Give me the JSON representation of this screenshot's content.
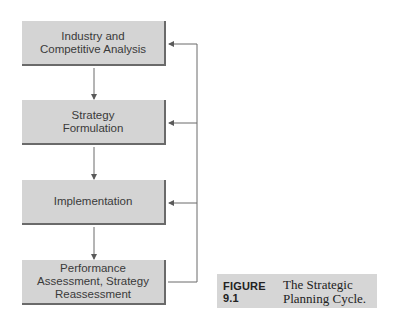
{
  "diagram": {
    "boxes": [
      {
        "label": "Industry and\nCompetitive Analysis"
      },
      {
        "label": "Strategy\nFormulation"
      },
      {
        "label": "Implementation"
      },
      {
        "label": "Performance\nAssessment, Strategy\nReassessment"
      }
    ],
    "caption": {
      "figure_label": "FIGURE 9.1",
      "text": "The Strategic\nPlanning Cycle."
    },
    "colors": {
      "box_fill": "#d4d4d4",
      "box_shadow": "#6a6a6a",
      "line": "#6a6a6a",
      "caption_fill": "#d6d6d6"
    }
  }
}
